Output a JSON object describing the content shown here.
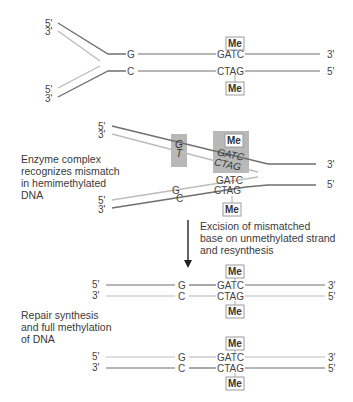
{
  "colors": {
    "dark_strand": "#6f6f6f",
    "light_strand": "#b8b8b8",
    "enzyme_box": "#b5b5b5",
    "me_border": "#9a9a9a",
    "text": "#333333"
  },
  "labels": {
    "enzyme": [
      "Enzyme complex",
      "recognizes mismatch",
      "in hemimethylated",
      "DNA"
    ],
    "excision": [
      "Excision of mismatched",
      "base on unmethylated strand",
      "and resynthesis"
    ],
    "repair": [
      "Repair synthesis",
      "and full methylation",
      "of DNA"
    ]
  },
  "stage1": {
    "ends_left": [
      "5'",
      "3'",
      "5'",
      "3'"
    ],
    "ends_right": [
      "3'",
      "5'"
    ],
    "top_base": "G",
    "bottom_base": "C",
    "top_site": "GATC",
    "bottom_site": "CTAG",
    "methyl_top": "Me",
    "methyl_bottom": "Me"
  },
  "stage2": {
    "ends_left": [
      "5'",
      "3'",
      "5'",
      "3'"
    ],
    "ends_right": [
      "3'",
      "5'"
    ],
    "mismatch_top": "G",
    "mismatch_bottom": "T",
    "enzyme_site_top": "GATC",
    "enzyme_site_bottom": "CTAG",
    "lower_base_top": "G",
    "lower_base_bottom": "C",
    "lower_site_top": "GATC",
    "lower_site_bottom": "CTAG",
    "methyl_enzyme": "Me",
    "methyl_lower": "Me"
  },
  "stage3": {
    "ends_left": [
      "5'",
      "3'"
    ],
    "ends_right": [
      "3'",
      "5'"
    ],
    "top_base": "G",
    "bottom_base": "C",
    "top_site": "GATC",
    "bottom_site": "CTAG",
    "methyl_top": "Me",
    "methyl_bottom": "Me"
  },
  "stage4": {
    "ends_left": [
      "5'",
      "3'"
    ],
    "ends_right": [
      "3'",
      "5'"
    ],
    "top_base": "G",
    "bottom_base": "C",
    "top_site": "GATC",
    "bottom_site": "CTAG",
    "methyl_top": "Me",
    "methyl_bottom": "Me"
  }
}
